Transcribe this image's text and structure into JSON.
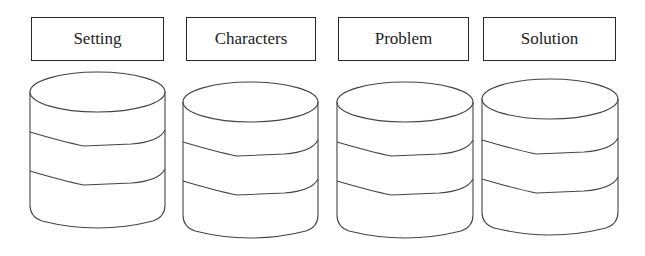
{
  "diagram": {
    "columns": [
      {
        "label": "Setting",
        "box": {
          "x": 31,
          "y": 17,
          "w": 133,
          "h": 44
        },
        "cylinder": {
          "x": 30,
          "w": 135,
          "top": 72,
          "bottom": 231,
          "ry": 20,
          "bands": [
            132,
            171
          ]
        }
      },
      {
        "label": "Characters",
        "box": {
          "x": 186,
          "y": 17,
          "w": 130,
          "h": 44
        },
        "cylinder": {
          "x": 183,
          "w": 135,
          "top": 82,
          "bottom": 241,
          "ry": 20,
          "bands": [
            142,
            181
          ]
        }
      },
      {
        "label": "Problem",
        "box": {
          "x": 338,
          "y": 17,
          "w": 131,
          "h": 44
        },
        "cylinder": {
          "x": 337,
          "w": 136,
          "top": 82,
          "bottom": 241,
          "ry": 20,
          "bands": [
            142,
            181
          ]
        }
      },
      {
        "label": "Solution",
        "box": {
          "x": 483,
          "y": 17,
          "w": 133,
          "h": 44
        },
        "cylinder": {
          "x": 482,
          "w": 136,
          "top": 79,
          "bottom": 238,
          "ry": 20,
          "bands": [
            140,
            179
          ]
        }
      }
    ]
  }
}
